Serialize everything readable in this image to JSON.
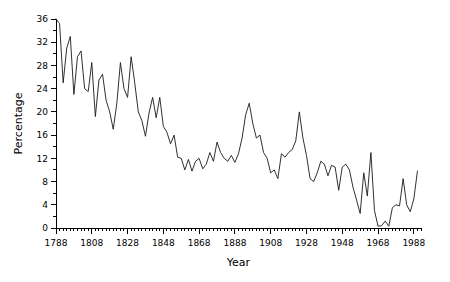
{
  "chart_data": {
    "type": "line",
    "title": "",
    "xlabel": "Year",
    "ylabel": "Percentage",
    "xlim": [
      1788,
      1992
    ],
    "ylim": [
      0,
      36
    ],
    "grid": false,
    "legend": null,
    "x_tick_labels": [
      "1788",
      "1808",
      "1828",
      "1848",
      "1868",
      "1888",
      "1908",
      "1928",
      "1948",
      "1968",
      "1988"
    ],
    "x_tick_values": [
      1788,
      1808,
      1828,
      1848,
      1868,
      1888,
      1908,
      1928,
      1948,
      1968,
      1988
    ],
    "x_minor_tick_step": 2,
    "y_tick_labels": [
      "0",
      "4",
      "8",
      "12",
      "16",
      "20",
      "24",
      "28",
      "32",
      "36"
    ],
    "y_tick_values": [
      0,
      4,
      8,
      12,
      16,
      20,
      24,
      28,
      32,
      36
    ],
    "y_minor_tick_step": 2,
    "line_color": "#1a1a1a",
    "series": [
      {
        "name": "Percentage",
        "x": [
          1788,
          1790,
          1792,
          1794,
          1796,
          1798,
          1800,
          1802,
          1804,
          1806,
          1808,
          1810,
          1812,
          1814,
          1816,
          1818,
          1820,
          1822,
          1824,
          1826,
          1828,
          1830,
          1832,
          1834,
          1836,
          1838,
          1840,
          1842,
          1844,
          1846,
          1848,
          1850,
          1852,
          1854,
          1856,
          1858,
          1860,
          1862,
          1864,
          1866,
          1868,
          1870,
          1872,
          1874,
          1876,
          1878,
          1880,
          1882,
          1884,
          1886,
          1888,
          1890,
          1892,
          1894,
          1896,
          1898,
          1900,
          1902,
          1904,
          1906,
          1908,
          1910,
          1912,
          1914,
          1916,
          1918,
          1920,
          1922,
          1924,
          1926,
          1928,
          1930,
          1932,
          1934,
          1936,
          1938,
          1940,
          1942,
          1944,
          1946,
          1948,
          1950,
          1952,
          1954,
          1956,
          1958,
          1960,
          1962,
          1964,
          1966,
          1968,
          1970,
          1972,
          1974,
          1976,
          1978,
          1980,
          1982,
          1984,
          1986,
          1988,
          1990
        ],
        "values": [
          36.0,
          35.2,
          25.0,
          31.0,
          33.0,
          23.0,
          29.5,
          30.5,
          24.0,
          23.5,
          28.5,
          19.2,
          25.5,
          26.5,
          22.0,
          20.0,
          17.0,
          21.5,
          28.5,
          24.0,
          22.5,
          29.5,
          25.0,
          20.0,
          18.5,
          15.8,
          19.8,
          22.5,
          19.0,
          22.5,
          17.5,
          16.5,
          14.5,
          16.0,
          12.2,
          12.0,
          10.0,
          11.8,
          9.8,
          11.5,
          12.0,
          10.2,
          11.0,
          13.0,
          11.5,
          14.8,
          13.0,
          12.0,
          11.5,
          12.5,
          11.3,
          12.8,
          15.5,
          19.5,
          21.5,
          18.0,
          15.5,
          16.0,
          13.0,
          12.0,
          9.5,
          10.0,
          8.5,
          12.8,
          12.2,
          13.0,
          13.5,
          15.0,
          20.0,
          15.5,
          12.5,
          8.5,
          8.0,
          9.5,
          11.5,
          11.0,
          9.0,
          10.8,
          10.5,
          6.5,
          10.5,
          11.0,
          10.0,
          7.0,
          4.8,
          2.5,
          9.5,
          5.5,
          13.0,
          3.0,
          0.3,
          0.4,
          1.2,
          0.3,
          3.5,
          4.0,
          3.8,
          8.5,
          4.0,
          2.8,
          5.0,
          9.8
        ]
      }
    ]
  }
}
